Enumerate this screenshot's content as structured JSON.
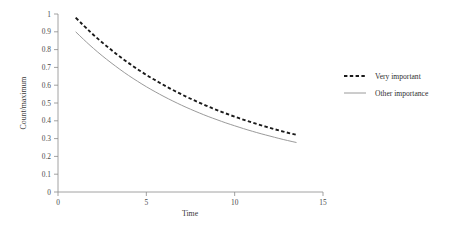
{
  "chart_data": {
    "type": "line",
    "title": "",
    "subtitle": "",
    "xlabel": "Time",
    "ylabel": "Count/maximum",
    "xlim": [
      0,
      15
    ],
    "ylim": [
      0,
      1
    ],
    "xticks": [
      0,
      5,
      10,
      15
    ],
    "xtick_labels": [
      "0",
      "5",
      "10",
      "15"
    ],
    "yticks": [
      0,
      0.1,
      0.2,
      0.3,
      0.4,
      0.5,
      0.6,
      0.7,
      0.8,
      0.9,
      1
    ],
    "ytick_labels": [
      "0",
      "0.1",
      "0.2",
      "0.3",
      "0.4",
      "0.5",
      "0.6",
      "0.7",
      "0.8",
      "0.9",
      "1"
    ],
    "grid": false,
    "legend_position": "right",
    "x": [
      1,
      1.5,
      2,
      2.5,
      3,
      3.5,
      4,
      4.5,
      5,
      5.5,
      6,
      6.5,
      7,
      7.5,
      8,
      8.5,
      9,
      9.5,
      10,
      10.5,
      11,
      11.5,
      12,
      12.5,
      13,
      13.5
    ],
    "series": [
      {
        "name": "Very important",
        "style": "dashed",
        "color": "#1a1a1a",
        "values": [
          0.98,
          0.93,
          0.883,
          0.84,
          0.799,
          0.76,
          0.724,
          0.69,
          0.658,
          0.628,
          0.6,
          0.573,
          0.548,
          0.524,
          0.502,
          0.48,
          0.46,
          0.441,
          0.423,
          0.406,
          0.39,
          0.375,
          0.36,
          0.346,
          0.333,
          0.321
        ]
      },
      {
        "name": "Other importance",
        "style": "solid",
        "color": "#9a9a9a",
        "values": [
          0.9,
          0.852,
          0.807,
          0.765,
          0.726,
          0.689,
          0.654,
          0.622,
          0.591,
          0.563,
          0.536,
          0.511,
          0.487,
          0.465,
          0.444,
          0.424,
          0.406,
          0.388,
          0.372,
          0.356,
          0.341,
          0.327,
          0.314,
          0.301,
          0.289,
          0.278
        ]
      }
    ],
    "legend": [
      {
        "label": "Very important",
        "style": "dashed",
        "color": "#1a1a1a"
      },
      {
        "label": "Other importance",
        "style": "solid",
        "color": "#9a9a9a"
      }
    ]
  }
}
